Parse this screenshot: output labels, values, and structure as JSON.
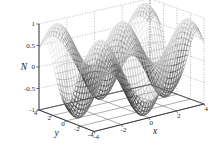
{
  "figure": {
    "background_color": "#ffffff",
    "width": 216,
    "height": 159
  },
  "axes": {
    "z": {
      "label": "N",
      "ticks": [
        "1",
        "0.5",
        "0",
        "-0.5",
        "-1"
      ],
      "tick_values": [
        1,
        0.5,
        0,
        -0.5,
        -1
      ],
      "range": [
        -1,
        1
      ]
    },
    "y": {
      "label": "y",
      "ticks": [
        "4",
        "2",
        "0",
        "-2",
        "-4"
      ],
      "tick_values": [
        4,
        2,
        0,
        -2,
        -4
      ],
      "range": [
        -4,
        4
      ]
    },
    "x": {
      "label": "x",
      "ticks": [
        "-4",
        "-2",
        "0",
        "2",
        "4"
      ],
      "tick_values": [
        -4,
        -2,
        0,
        2,
        4
      ],
      "range": [
        -4,
        4
      ]
    }
  },
  "style": {
    "axis_color": "#555555",
    "grid_color": "#8a8a8a",
    "text_color": "#2b2b2b",
    "mesh_dark": "#1c1c1c",
    "mesh_light": "#d8d8d8"
  },
  "chart_data": {
    "type": "surface",
    "title": "",
    "xlabel": "x",
    "ylabel": "y",
    "zlabel": "N",
    "xlim": [
      -4,
      4
    ],
    "ylim": [
      -4,
      4
    ],
    "zlim": [
      -1,
      1
    ],
    "xticks": [
      -4,
      -2,
      0,
      2,
      4
    ],
    "yticks": [
      -4,
      -2,
      0,
      2,
      4
    ],
    "zticks": [
      -1,
      -0.5,
      0,
      0.5,
      1
    ],
    "grid": true,
    "legend": false,
    "colormap": "grayscale",
    "rendering": "wireframe-mesh",
    "function": "cos(x)*cos(y)",
    "features": {
      "peaks": [
        {
          "x": 0,
          "y": 0,
          "z": 1
        },
        {
          "x": 3.14,
          "y": 3.14,
          "z": 1
        },
        {
          "x": -3.14,
          "y": -3.14,
          "z": 1
        },
        {
          "x": 3.14,
          "y": -3.14,
          "z": 1
        },
        {
          "x": -3.14,
          "y": 3.14,
          "z": 1
        }
      ],
      "valleys": [
        {
          "x": 3.14,
          "y": 0,
          "z": -1
        },
        {
          "x": -3.14,
          "y": 0,
          "z": -1
        },
        {
          "x": 0,
          "y": 3.14,
          "z": -1
        },
        {
          "x": 0,
          "y": -3.14,
          "z": -1
        }
      ]
    },
    "view": {
      "azimuth": -37.5,
      "elevation": 30
    }
  }
}
